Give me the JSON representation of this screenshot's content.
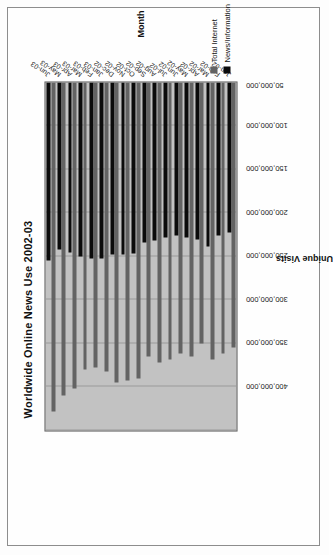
{
  "chart_data": {
    "type": "bar",
    "orientation": "horizontal",
    "title": "Worldwide Online News Use 2002-03",
    "xlabel": "Month",
    "ylabel": "Unique Visits",
    "categories": [
      "Jan-02",
      "Feb-02",
      "Mar-02",
      "Apr-02",
      "May-02",
      "Jun-02",
      "Jul-02",
      "Aug-02",
      "Sep-02",
      "Oct-02",
      "Nov-02",
      "Dec-02",
      "Jan-03",
      "Feb-03",
      "Mar-03",
      "Apr-03",
      "May-03",
      "Jun-03"
    ],
    "series": [
      {
        "name": "Total Internet",
        "color": "#636363",
        "values": [
          305000000,
          312000000,
          318000000,
          300000000,
          315000000,
          312000000,
          318000000,
          322000000,
          315000000,
          340000000,
          342000000,
          345000000,
          332000000,
          328000000,
          330000000,
          352000000,
          360000000,
          378000000
        ]
      },
      {
        "name": "News/Information",
        "color": "#0b0b0b",
        "values": [
          172000000,
          176000000,
          188000000,
          180000000,
          178000000,
          176000000,
          178000000,
          182000000,
          184000000,
          196000000,
          198000000,
          198000000,
          202000000,
          202000000,
          200000000,
          195000000,
          192000000,
          205000000
        ]
      }
    ],
    "value_ticks": [
      "50,000,000",
      "100,000,000",
      "150,000,000",
      "200,000,000",
      "250,000,000",
      "300,000,000",
      "350,000,000",
      "400,000,000"
    ],
    "value_tick_numbers": [
      50000000,
      100000000,
      150000000,
      200000000,
      250000000,
      300000000,
      350000000,
      400000000
    ],
    "ylim": [
      0,
      400000000
    ],
    "grid": true,
    "legend_position": "bottom-right",
    "plot_background": "#c2c2c2"
  },
  "legend": {
    "items": [
      {
        "label": "Total Internet"
      },
      {
        "label": "News/Information"
      }
    ]
  }
}
